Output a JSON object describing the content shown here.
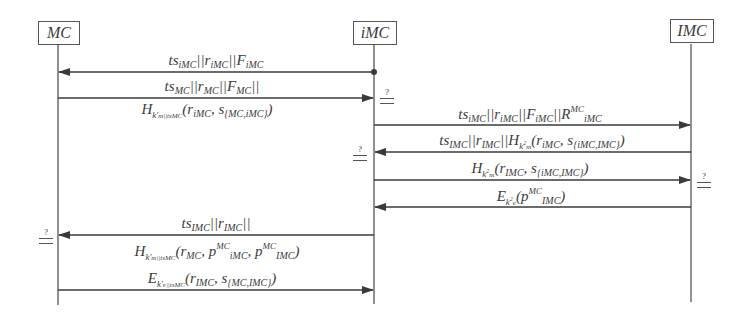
{
  "diagram": {
    "type": "sequence",
    "participants": [
      {
        "id": "MC",
        "label": "MC"
      },
      {
        "id": "iMC",
        "label": "iMC"
      },
      {
        "id": "IMC",
        "label": "IMC"
      }
    ],
    "verify_symbol": "?",
    "messages": [
      {
        "from": "iMC",
        "to": "MC",
        "label": "ts_iMC || r_iMC || F_iMC",
        "start_dot": true
      },
      {
        "from": "MC",
        "to": "iMC",
        "label": "ts_MC || r_MC || F_MC || H_k'_m||tsMC(r_iMC, s_{MC,iMC})",
        "verify_at": "iMC"
      },
      {
        "from": "iMC",
        "to": "IMC",
        "label": "ts_iMC || r_iMC || F_iMC || R^MC_iMC"
      },
      {
        "from": "IMC",
        "to": "iMC",
        "label": "ts_IMC || r_IMC || H_k²_m(r_iMC, s_{iMC,IMC})",
        "verify_at": "iMC"
      },
      {
        "from": "iMC",
        "to": "IMC",
        "label": "H_k²_m(r_IMC, s_{iMC,IMC})",
        "verify_at": "IMC"
      },
      {
        "from": "IMC",
        "to": "iMC",
        "label": "E_k²_e(p^MC_IMC)"
      },
      {
        "from": "iMC",
        "to": "MC",
        "label": "ts_IMC || r_IMC || H_k'_m||tsMC(r_MC, p^MC_iMC, p^MC_IMC)",
        "verify_at": "MC"
      },
      {
        "from": "MC",
        "to": "iMC",
        "label": "E_k'_e||tsMC(r_IMC, s_{MC,IMC})"
      }
    ]
  },
  "text": {
    "p_mc": "MC",
    "p_imc_mid": "iMC",
    "p_imc_right": "IMC",
    "q": "?",
    "m1": {
      "a": "ts",
      "a_sub": "iMC",
      "b": "||r",
      "b_sub": "iMC",
      "c": "||F",
      "c_sub": "iMC"
    },
    "m2a": {
      "a": "ts",
      "a_sub": "MC",
      "b": "||r",
      "b_sub": "MC",
      "c": "||F",
      "c_sub": "MC",
      "d": "||"
    },
    "m2b": {
      "h": "H",
      "k": "k'",
      "k_sub": "m||tsMC",
      "args_open": "(r",
      "r_sub": "iMC",
      "sep": ", s",
      "s_sub": "{MC,iMC}",
      "close": ")"
    },
    "m3": {
      "a": "ts",
      "a_sub": "iMC",
      "b": "||r",
      "b_sub": "iMC",
      "c": "||F",
      "c_sub": "iMC",
      "d": "||R",
      "d_sup": "MC",
      "d_sub": "iMC"
    },
    "m4": {
      "a": "ts",
      "a_sub": "IMC",
      "b": "||r",
      "b_sub": "IMC",
      "c": "||H",
      "k": "k",
      "k_sup": "2",
      "k_sub": "m",
      "args_open": "(r",
      "r_sub": "iMC",
      "sep": ", s",
      "s_sub": "{iMC,IMC}",
      "close": ")"
    },
    "m5": {
      "h": "H",
      "k": "k",
      "k_sup": "2",
      "k_sub": "m",
      "args_open": "(r",
      "r_sub": "IMC",
      "sep": ", s",
      "s_sub": "{iMC,IMC}",
      "close": ")"
    },
    "m6": {
      "e": "E",
      "k": "k",
      "k_sup": "2",
      "k_sub": "e",
      "args_open": "(p",
      "p_sup": "MC",
      "p_sub": "IMC",
      "close": ")"
    },
    "m7a": {
      "a": "ts",
      "a_sub": "IMC",
      "b": "||r",
      "b_sub": "IMC",
      "c": "||"
    },
    "m7b": {
      "h": "H",
      "k": "k'",
      "k_sub": "m||tsMC",
      "args_open": "(r",
      "r_sub": "MC",
      "sep1": ", p",
      "p1_sup": "MC",
      "p1_sub": "iMC",
      "sep2": ", p",
      "p2_sup": "MC",
      "p2_sub": "IMC",
      "close": ")"
    },
    "m8": {
      "e": "E",
      "k": "k'",
      "k_sub": "e||tsMC",
      "args_open": "(r",
      "r_sub": "IMC",
      "sep": ", s",
      "s_sub": "{MC,IMC}",
      "close": ")"
    }
  }
}
